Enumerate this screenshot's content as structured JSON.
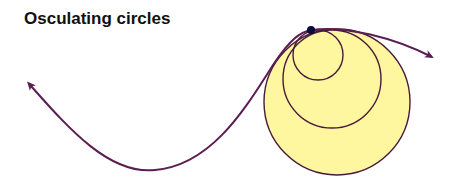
{
  "title": "Osculating circles",
  "colors": {
    "curve": "#5a1e52",
    "circle_fill": "#fff6a0",
    "circle_stroke": "#4a1a3a",
    "point": "#0a0a3a",
    "background": "#ffffff"
  },
  "point": {
    "x": 311,
    "y": 30,
    "r": 4
  },
  "circles": [
    {
      "name": "large",
      "cx": 337,
      "cy": 102,
      "r": 73
    },
    {
      "name": "medium",
      "cx": 332,
      "cy": 79,
      "r": 49
    },
    {
      "name": "small",
      "cx": 318,
      "cy": 55,
      "r": 25
    }
  ],
  "curve": {
    "path": "M 31 86 C 70 130, 110 175, 155 170 C 215 165, 250 100, 275 62 C 290 40, 300 32, 311 30 C 345 25, 395 38, 432 57",
    "arrow_left": {
      "x": 31,
      "y": 86,
      "angle": -135
    },
    "arrow_right": {
      "x": 432,
      "y": 57,
      "angle": 27
    }
  }
}
